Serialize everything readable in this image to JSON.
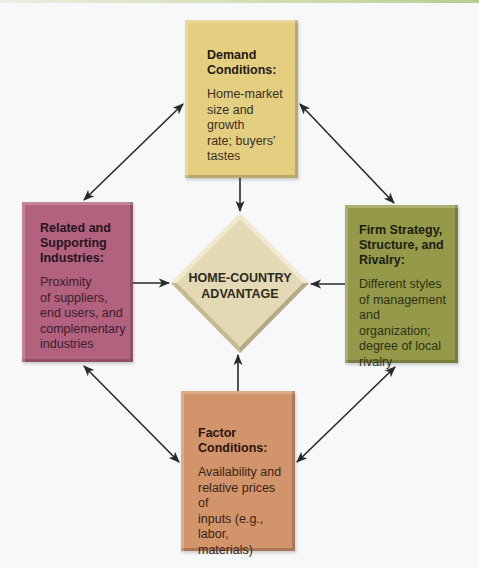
{
  "diagram": {
    "center": {
      "label": "HOME-COUNTRY\nADVANTAGE",
      "color": "#e3d9b4"
    },
    "nodes": [
      {
        "id": "demand",
        "title": "Demand\nConditions:",
        "description": "Home-market\nsize and growth\nrate; buyers'\ntastes",
        "color": "#e4cf80",
        "position": "top"
      },
      {
        "id": "related",
        "title": "Related and\nSupporting\nIndustries:",
        "description": "Proximity\nof suppliers,\nend users, and\ncomplementary\nindustries",
        "color": "#b2617f",
        "position": "left"
      },
      {
        "id": "firm",
        "title": "Firm Strategy,\nStructure, and\nRivalry:",
        "description": "Different styles\nof management\nand organization;\ndegree of local\nrivalry",
        "color": "#949a4a",
        "position": "right"
      },
      {
        "id": "factor",
        "title": "Factor\nConditions:",
        "description": "Availability and\nrelative prices of\ninputs (e.g.,\nlabor, materials)",
        "color": "#d2946a",
        "position": "bottom"
      }
    ],
    "edges": [
      {
        "from": "demand",
        "to": "center",
        "type": "one-way"
      },
      {
        "from": "related",
        "to": "center",
        "type": "one-way"
      },
      {
        "from": "firm",
        "to": "center",
        "type": "one-way"
      },
      {
        "from": "factor",
        "to": "center",
        "type": "one-way"
      },
      {
        "from": "demand",
        "to": "related",
        "type": "two-way"
      },
      {
        "from": "demand",
        "to": "firm",
        "type": "two-way"
      },
      {
        "from": "related",
        "to": "factor",
        "type": "two-way"
      },
      {
        "from": "firm",
        "to": "factor",
        "type": "two-way"
      }
    ]
  }
}
